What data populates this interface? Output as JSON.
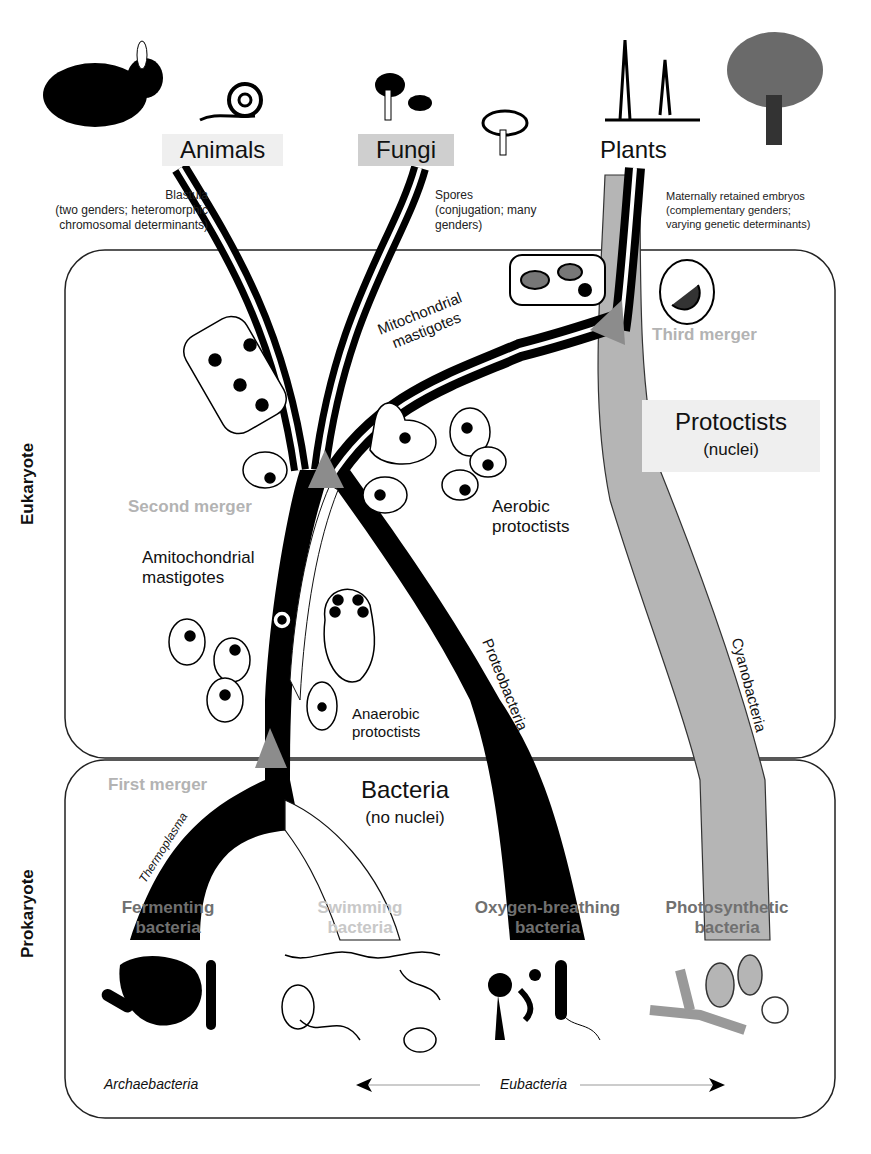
{
  "kingdoms": {
    "animals": "Animals",
    "fungi": "Fungi",
    "plants": "Plants"
  },
  "notes": {
    "animals": [
      "Blastula",
      "(two genders; heteromorphic",
      "chromosomal determinants)"
    ],
    "fungi": [
      "Spores",
      "(conjugation; many",
      "genders)"
    ],
    "plants": [
      "Maternally retained embryos",
      "(complementary genders;",
      "varying genetic determinants)"
    ]
  },
  "domains": {
    "eukaryote": "Eukaryote",
    "prokaryote": "Prokaryote"
  },
  "protoctists": {
    "title": "Protoctists",
    "sub": "(nuclei)"
  },
  "bacteria": {
    "title": "Bacteria",
    "sub": "(no nuclei)"
  },
  "mergers": {
    "first": "First merger",
    "second": "Second merger",
    "third": "Third merger"
  },
  "groups": {
    "mitochondrial": [
      "Mitochondrial",
      "mastigotes"
    ],
    "amitochondrial": [
      "Amitochondrial",
      "mastigotes"
    ],
    "aerobic": [
      "Aerobic",
      "protoctists"
    ],
    "anaerobic": [
      "Anaerobic",
      "protoctists"
    ]
  },
  "branches": {
    "proteobacteria": "Proteobacteria",
    "cyanobacteria": "Cyanobacteria",
    "thermoplasma": "Thermoplasma"
  },
  "bacteria_types": [
    {
      "line1": "Fermenting",
      "line2": "bacteria",
      "color": "#707070"
    },
    {
      "line1": "Swimming",
      "line2": "bacteria",
      "color": "#c8c8c8"
    },
    {
      "line1": "Oxygen-breathing",
      "line2": "bacteria",
      "color": "#707070"
    },
    {
      "line1": "Photosynthetic",
      "line2": "bacteria",
      "color": "#707070"
    }
  ],
  "bottom": {
    "archaebacteria": "Archaebacteria",
    "eubacteria": "Eubacteria"
  },
  "colors": {
    "lineage_black": "#000000",
    "cyanobacteria_gray": "#b5b5b5",
    "merger_triangle": "#8c8c8c",
    "merger_text": "#b3b3b3"
  }
}
